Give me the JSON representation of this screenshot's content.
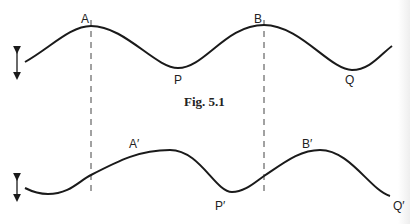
{
  "figure": {
    "caption": "Fig. 5.1",
    "top_wave": {
      "labels": {
        "A": "A",
        "B": "B",
        "P": "P",
        "Q": "Q"
      }
    },
    "bottom_wave": {
      "labels": {
        "A": "A′",
        "B": "B′",
        "P": "P′",
        "Q": "Q′"
      }
    },
    "colors": {
      "line": "#1a1a1a",
      "dashed": "#444444",
      "background": "#ffffff"
    }
  }
}
